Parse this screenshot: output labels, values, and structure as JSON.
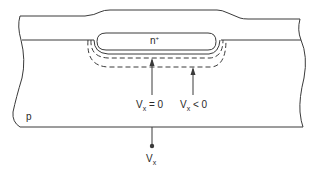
{
  "diagram": {
    "type": "semiconductor cross-section",
    "colors": {
      "stroke": "#3a3a3a",
      "background": "#ffffff"
    },
    "regions": {
      "n_plus": {
        "label": "n",
        "superscript": "+"
      },
      "substrate": {
        "label": "p"
      }
    },
    "annotations": {
      "arrow_zero_bias": {
        "v": "V",
        "sub": "x",
        "rel": " = 0"
      },
      "arrow_reverse_bias": {
        "v": "V",
        "sub": "x",
        "rel": " < 0"
      }
    },
    "terminal": {
      "v": "V",
      "sub": "x"
    },
    "depletion_edges": [
      {
        "condition": "Vx = 0",
        "style": "dashed"
      },
      {
        "condition": "Vx < 0",
        "style": "dashed"
      }
    ]
  }
}
